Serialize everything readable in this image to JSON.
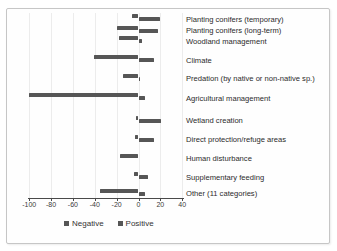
{
  "chart_data": {
    "type": "bar",
    "orientation": "horizontal-diverging",
    "title": "",
    "xlabel": "",
    "ylabel": "",
    "xlim": [
      -100,
      40
    ],
    "xticks": [
      -100,
      -80,
      -60,
      -40,
      -20,
      0,
      20,
      40
    ],
    "grid": "faint-vertical",
    "legend_position": "bottom",
    "categories": [
      "Planting conifers (temporary)",
      "Planting conifers (long-term)",
      "Woodland management",
      "Climate",
      "Predation (by native or non-native sp.)",
      "Agricultural management",
      "Wetland creation",
      "Direct protection/refuge areas",
      "Human disturbance",
      "Supplementary feeding",
      "Other (11 categories)"
    ],
    "series": [
      {
        "name": "Negative",
        "values": [
          -6,
          -20,
          -18,
          -41,
          -14,
          -100,
          -2,
          -3,
          -17,
          -4,
          -35
        ]
      },
      {
        "name": "Positive",
        "values": [
          20,
          18,
          3,
          14,
          1,
          6,
          21,
          14,
          0,
          9,
          6
        ]
      }
    ],
    "color_negative": "#565656",
    "color_positive": "#565656"
  }
}
